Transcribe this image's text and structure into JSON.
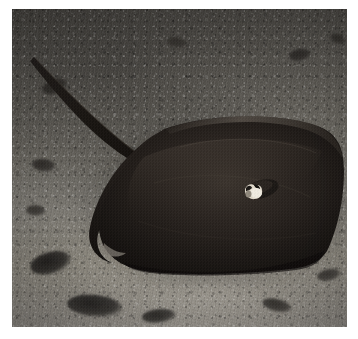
{
  "image": {
    "kind": "photograph",
    "subject": "stingray",
    "scene_description": "An underwater photograph of a dark grey-brown stingray resting on a coarse sandy seabed",
    "orientation": "landscape",
    "border": {
      "style": "white margin",
      "color": "#ffffff",
      "left_px": 12,
      "top_px": 9,
      "right_px": 11,
      "bottom_px": 12
    },
    "canvas": {
      "width": 358,
      "height": 339
    },
    "photo_area": {
      "x": 12,
      "y": 9,
      "width": 335,
      "height": 318
    }
  },
  "palette": {
    "sand_light": "#8a8680",
    "sand_mid": "#6d6a63",
    "sand_dark": "#4e4b46",
    "rubble_dark": "#232120",
    "ray_body": "#231f1d",
    "ray_body_deep": "#15120f",
    "ray_highlight": "#5a5049",
    "wound_white": "#e8e3d8",
    "frame_white": "#ffffff"
  },
  "subject": {
    "name": "stingray",
    "body": {
      "label": "stingray disc",
      "position": {
        "x": 72,
        "y": 108,
        "width": 262,
        "height": 165
      },
      "tone": "very dark brown-black, smooth, matte"
    },
    "tail": {
      "label": "stingray tail",
      "description": "long slender whip-like tail extending to the upper left of the frame",
      "start": {
        "x": 26,
        "y": 56
      },
      "end": {
        "x": 150,
        "y": 150
      }
    },
    "marking": {
      "label": "bright pale patch on back",
      "description": "small bright off-white marking / wound near the spiracle area",
      "position": {
        "x": 231,
        "y": 172,
        "width": 22,
        "height": 20
      }
    },
    "left_wing_notch": {
      "label": "left pectoral fin notch",
      "position": {
        "x": 88,
        "y": 228
      }
    }
  },
  "background": {
    "label": "seabed",
    "description": "coarse sand and gravel with scattered darker algae-covered rubble patches",
    "lighting": "brighter toward the lower right, falling into shadow at the top and corners",
    "rubble_patches": [
      {
        "name": "rubble-upper-left",
        "x": 30,
        "y": 70,
        "w": 26,
        "h": 15,
        "tone": "#2a2724",
        "rot": -18
      },
      {
        "name": "rubble-upper-mid",
        "x": 155,
        "y": 28,
        "w": 20,
        "h": 11,
        "tone": "#33302c",
        "rot": 12
      },
      {
        "name": "rubble-upper-right",
        "x": 277,
        "y": 40,
        "w": 22,
        "h": 12,
        "tone": "#2e2b28",
        "rot": -8
      },
      {
        "name": "rubble-right-edge",
        "x": 318,
        "y": 25,
        "w": 16,
        "h": 10,
        "tone": "#34312d",
        "rot": 20
      },
      {
        "name": "rubble-left-mid",
        "x": 20,
        "y": 150,
        "w": 24,
        "h": 13,
        "tone": "#2c2926",
        "rot": 8
      },
      {
        "name": "rubble-left-lower",
        "x": 18,
        "y": 243,
        "w": 42,
        "h": 22,
        "tone": "#1f1d1b",
        "rot": -14
      },
      {
        "name": "rubble-bottom-left",
        "x": 55,
        "y": 286,
        "w": 56,
        "h": 22,
        "tone": "#23211f",
        "rot": 6
      },
      {
        "name": "rubble-bottom-mid",
        "x": 130,
        "y": 300,
        "w": 34,
        "h": 14,
        "tone": "#2b2926",
        "rot": -5
      },
      {
        "name": "rubble-bottom-right",
        "x": 250,
        "y": 290,
        "w": 30,
        "h": 13,
        "tone": "#35322e",
        "rot": 15
      },
      {
        "name": "rubble-far-right",
        "x": 305,
        "y": 260,
        "w": 24,
        "h": 12,
        "tone": "#3a3733",
        "rot": -10
      },
      {
        "name": "rubble-mid-left",
        "x": 14,
        "y": 196,
        "w": 20,
        "h": 11,
        "tone": "#36332f",
        "rot": 4
      }
    ]
  },
  "annotations": {
    "has_text_overlay": false,
    "has_watermark": false,
    "visible_text": ""
  }
}
